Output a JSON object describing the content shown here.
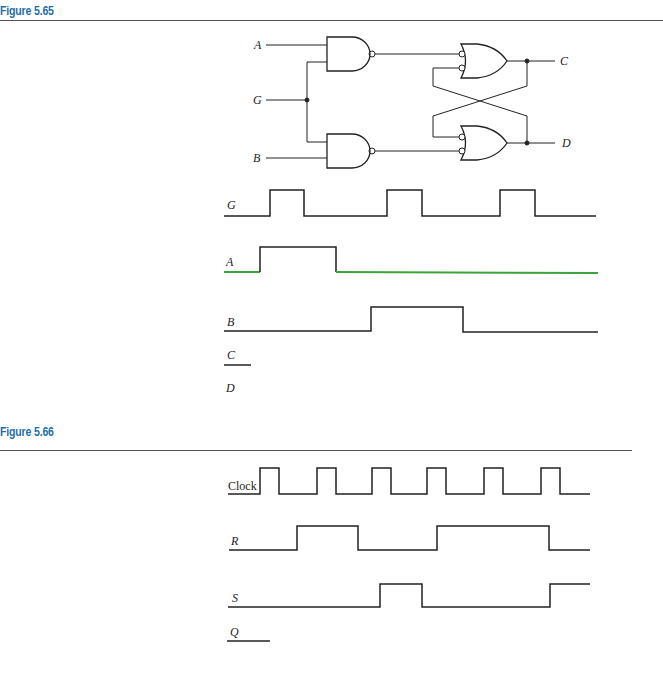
{
  "figures": [
    {
      "title": "Figure 5.65",
      "circuit": {
        "inputs": [
          "A",
          "G",
          "B"
        ],
        "outputs": [
          "C",
          "D"
        ],
        "gates": [
          "NAND (A,G)",
          "NAND (G,B)",
          "OR with inverted inputs (top)",
          "OR with inverted inputs (bottom)"
        ]
      },
      "timing": {
        "signals": [
          {
            "name": "G",
            "label": "G"
          },
          {
            "name": "A",
            "label": "A"
          },
          {
            "name": "B",
            "label": "B"
          },
          {
            "name": "C",
            "label": "C"
          },
          {
            "name": "D",
            "label": "D"
          }
        ]
      }
    },
    {
      "title": "Figure 5.66",
      "timing": {
        "signals": [
          {
            "name": "Clock",
            "label": "Clock"
          },
          {
            "name": "R",
            "label": "R"
          },
          {
            "name": "S",
            "label": "S"
          },
          {
            "name": "Q",
            "label": "Q"
          }
        ]
      }
    }
  ],
  "colors": {
    "title": "#1f6fa6",
    "wire": "#222222",
    "highlight_A_low": "#3aa43a"
  }
}
